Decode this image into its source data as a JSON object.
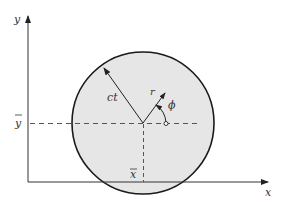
{
  "diagram": {
    "type": "geometry",
    "axes": {
      "x_label": "x",
      "y_label": "y"
    },
    "labels": {
      "radius": "ct",
      "r": "r",
      "phi": "ϕ",
      "y_bar": "y",
      "x_bar": "x"
    },
    "colors": {
      "circle_fill": "#e6e6e6",
      "circle_stroke": "#1a1a1a",
      "axis": "#333333",
      "dashed": "#555555",
      "background": "#ffffff"
    }
  }
}
